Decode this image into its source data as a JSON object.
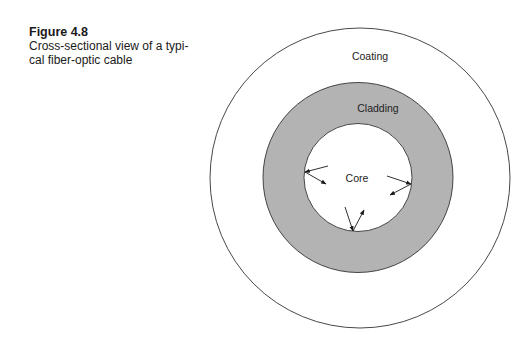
{
  "figure": {
    "number": "Figure 4.8",
    "caption_line1": "Cross-sectional view of a typi-",
    "caption_line2": "cal fiber-optic cable"
  },
  "diagram": {
    "layers": [
      {
        "name": "Coating",
        "fill": "#ffffff",
        "stroke": "#333333"
      },
      {
        "name": "Cladding",
        "fill": "#b3b3b3",
        "stroke": "#333333"
      },
      {
        "name": "Core",
        "fill": "#ffffff",
        "stroke": "#333333"
      }
    ],
    "labels": {
      "coating": "Coating",
      "cladding": "Cladding",
      "core": "Core"
    },
    "arrow_description": "Light rays reflecting off the core-cladding boundary (total internal reflection)"
  }
}
